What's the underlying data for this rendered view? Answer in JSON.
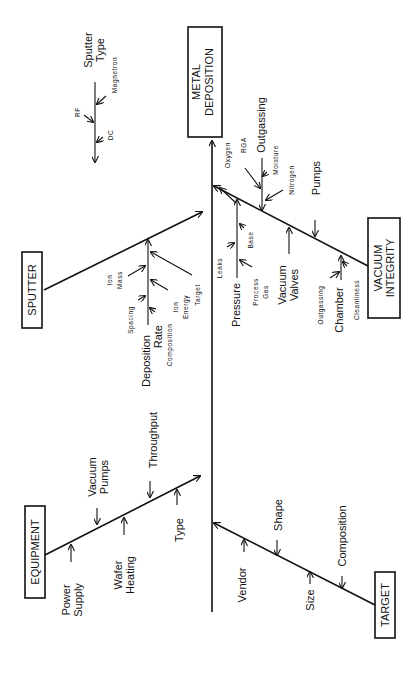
{
  "diagram": {
    "type": "fishbone",
    "orientation": "rotated-90-ccw",
    "effect": "METAL DEPOSITION",
    "categories": {
      "sputter": {
        "label": "SPUTTER",
        "causes": {
          "sputter_type": {
            "label": [
              "Sputter",
              "Type"
            ],
            "sub": [
              "RF",
              "DC",
              "Magnetron"
            ]
          },
          "deposition_rate": {
            "label": [
              "Deposition",
              "Rate"
            ],
            "sub": [
              "Ion",
              "Mass",
              "Spacing",
              "Composition",
              "Ion",
              "Energy",
              "Target"
            ]
          }
        }
      },
      "equipment": {
        "label": "EQUIPMENT",
        "causes": {
          "power_supply": [
            "Power",
            "Supply"
          ],
          "vacuum_pumps": [
            "Vacuum",
            "Pumps"
          ],
          "wafer_heating": [
            "Wafer",
            "Heating"
          ],
          "throughput": "Throughput",
          "type": "Type"
        }
      },
      "vacuum": {
        "label": [
          "VACUUM",
          "INTEGRITY"
        ],
        "causes": {
          "outgassing": {
            "label": "Outgassing",
            "sub": [
              "Oxygen",
              "RGA",
              "Moisture",
              "Nitrogen"
            ]
          },
          "pumps": "Pumps",
          "pressure": {
            "label": "Pressure",
            "sub": [
              "Leaks",
              "Base",
              "Process",
              "Gas"
            ]
          },
          "vacuum_valves": [
            "Vacuum",
            "Valves"
          ],
          "chamber": {
            "label": "Chamber",
            "sub": [
              "Outgassing",
              "Cleanliness"
            ]
          }
        }
      },
      "target": {
        "label": "TARGET",
        "causes": {
          "vendor": "Vendor",
          "shape": "Shape",
          "size": "Size",
          "composition": "Composition"
        }
      }
    }
  }
}
